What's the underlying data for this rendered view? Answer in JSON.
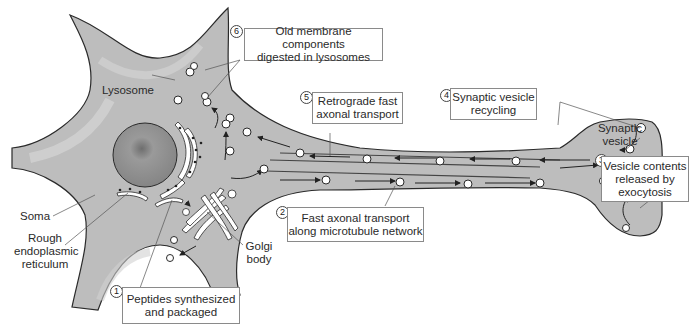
{
  "figure": {
    "colors": {
      "cytoplasm": "#bdbdbd",
      "cytoplasm_highlight": "#d2d2d2",
      "outline": "#2a2a2a",
      "nucleus": "#8e8e8e",
      "vesicle_fill": "#ffffff",
      "label_box_border": "#8a8a8a",
      "text": "#2a2a2a"
    }
  },
  "labels": {
    "lysosome": "Lysosome",
    "soma": "Soma",
    "rer_line1": "Rough",
    "rer_line2": "endoplasmic",
    "rer_line3": "reticulum",
    "golgi_line1": "Golgi",
    "golgi_line2": "body",
    "synaptic_vesicle_line1": "Synaptic",
    "synaptic_vesicle_line2": "vesicle"
  },
  "steps": [
    {
      "number": "1",
      "line1": "Peptides synthesized",
      "line2": "and packaged"
    },
    {
      "number": "2",
      "line1": "Fast axonal transport",
      "line2": "along microtubule network"
    },
    {
      "number": "3",
      "line1": "Vesicle contents",
      "line2": "released by",
      "line3": "exocytosis"
    },
    {
      "number": "4",
      "line1": "Synaptic vesicle",
      "line2": "recycling"
    },
    {
      "number": "5",
      "line1": "Retrograde fast",
      "line2": "axonal transport"
    },
    {
      "number": "6",
      "line1": "Old membrane components",
      "line2": "digested in lysosomes"
    }
  ]
}
